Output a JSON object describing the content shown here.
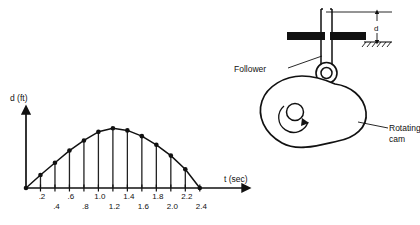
{
  "chart_data": {
    "type": "line",
    "title": "",
    "xlabel": "t (sec)",
    "ylabel": "d (ft)",
    "xlim": [
      0,
      2.9
    ],
    "ylim": [
      0,
      1.0
    ],
    "grid": false,
    "legend": null,
    "style": "stem-with-markers",
    "x": [
      0,
      0.2,
      0.4,
      0.6,
      0.8,
      1.0,
      1.2,
      1.4,
      1.6,
      1.8,
      2.0,
      2.2,
      2.4
    ],
    "values": [
      0,
      0.18,
      0.35,
      0.52,
      0.66,
      0.78,
      0.83,
      0.8,
      0.72,
      0.6,
      0.45,
      0.26,
      0
    ],
    "tick_labels_upper": [
      ".2",
      ".6",
      "1.0",
      "1.4",
      "1.8",
      "2.2"
    ],
    "tick_labels_lower": [
      ".4",
      ".8",
      "1.2",
      "1.6",
      "2.0",
      "2.4"
    ],
    "tick_values_upper": [
      0.2,
      0.6,
      1.0,
      1.4,
      1.8,
      2.2
    ],
    "tick_values_lower": [
      0.4,
      0.8,
      1.2,
      1.6,
      2.0,
      2.4
    ]
  },
  "axes": {
    "y_axis_label": "d (ft)",
    "x_axis_label": "t (sec)"
  },
  "mechanism": {
    "follower_label": "Follower",
    "cam_label_line1": "Rotating",
    "cam_label_line2": "cam",
    "displacement_label": "d",
    "rotation_icon": "rotation-arrow-icon",
    "ground_icon": "ground-hatch-icon"
  }
}
